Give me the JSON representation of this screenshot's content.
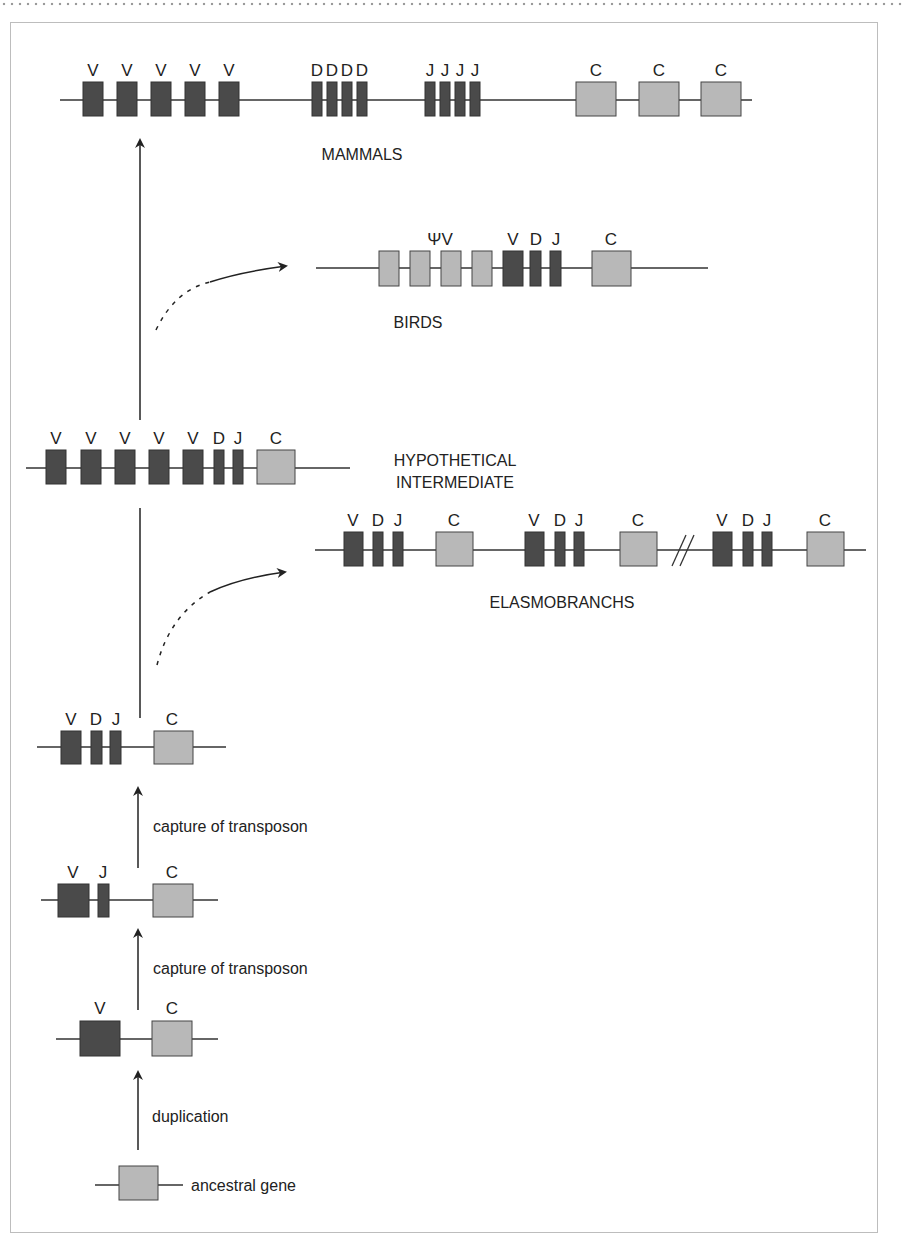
{
  "colors": {
    "dark_segment": "#4a4a4a",
    "light_segment": "#b8b8b8",
    "line": "#333333",
    "frame": "#bdbdbd"
  },
  "stages": {
    "ancestral": {
      "label": "ancestral gene"
    },
    "duplication": {
      "label": "duplication",
      "segments": [
        "V",
        "C"
      ]
    },
    "capture1": {
      "label": "capture of transposon",
      "segments": [
        "V",
        "J",
        "C"
      ]
    },
    "capture2": {
      "label": "capture of transposon",
      "segments": [
        "V",
        "D",
        "J",
        "C"
      ]
    },
    "hypothetical": {
      "title_line1": "HYPOTHETICAL",
      "title_line2": "INTERMEDIATE",
      "segments": [
        "V",
        "V",
        "V",
        "V",
        "V",
        "D",
        "J",
        "C"
      ]
    },
    "elasmobranchs": {
      "title": "ELASMOBRANCHS",
      "segments": [
        "V",
        "D",
        "J",
        "C",
        "V",
        "D",
        "J",
        "C",
        "V",
        "D",
        "J",
        "C"
      ],
      "break_mark": "//"
    },
    "birds": {
      "title": "BIRDS",
      "segments": [
        "ΨV",
        "V",
        "D",
        "J",
        "C"
      ]
    },
    "mammals": {
      "title": "MAMMALS",
      "segments": [
        "V",
        "V",
        "V",
        "V",
        "V",
        "DDDD",
        "JJJJ",
        "C",
        "C",
        "C"
      ]
    }
  },
  "labels": {
    "V": "V",
    "D": "D",
    "J": "J",
    "C": "C",
    "psiV": "ΨV"
  }
}
